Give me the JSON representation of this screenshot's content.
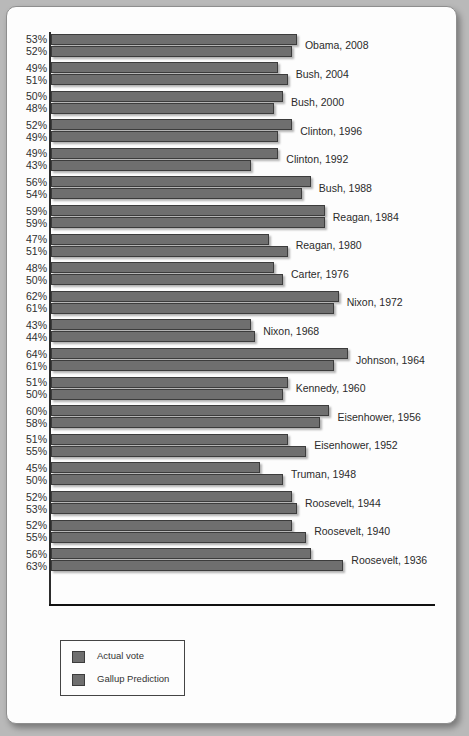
{
  "legend": {
    "items": [
      {
        "label": "Actual vote",
        "color": "#6f6f6f"
      },
      {
        "label": "Gallup Prediction",
        "color": "#6f6f6f"
      }
    ]
  },
  "chart_data": {
    "type": "bar",
    "orientation": "horizontal",
    "title": "",
    "xlabel": "",
    "ylabel": "",
    "xlim": [
      0,
      70
    ],
    "grid": false,
    "legend_position": "bottom-left",
    "categories": [
      "Obama, 2008",
      "Bush, 2004",
      "Bush, 2000",
      "Clinton, 1996",
      "Clinton, 1992",
      "Bush, 1988",
      "Reagan, 1984",
      "Reagan, 1980",
      "Carter, 1976",
      "Nixon, 1972",
      "Nixon, 1968",
      "Johnson, 1964",
      "Kennedy, 1960",
      "Eisenhower, 1956",
      "Eisenhower, 1952",
      "Truman, 1948",
      "Roosevelt, 1944",
      "Roosevelt, 1940",
      "Roosevelt, 1936"
    ],
    "series": [
      {
        "name": "Actual vote",
        "values": [
          53,
          49,
          50,
          52,
          49,
          56,
          59,
          47,
          48,
          62,
          43,
          64,
          51,
          60,
          51,
          45,
          52,
          52,
          56
        ]
      },
      {
        "name": "Gallup Prediction",
        "values": [
          52,
          51,
          48,
          49,
          43,
          54,
          59,
          51,
          50,
          61,
          44,
          61,
          50,
          58,
          55,
          50,
          53,
          55,
          63
        ]
      }
    ],
    "value_labels": {
      "actual": [
        "53%",
        "49%",
        "50%",
        "52%",
        "49%",
        "56%",
        "59%",
        "47%",
        "48%",
        "62%",
        "43%",
        "64%",
        "51%",
        "60%",
        "51%",
        "45%",
        "52%",
        "52%",
        "56%"
      ],
      "gallup": [
        "52%",
        "51%",
        "48%",
        "49%",
        "43%",
        "54%",
        "59%",
        "51%",
        "50%",
        "61%",
        "44%",
        "61%",
        "50%",
        "58%",
        "55%",
        "50%",
        "53%",
        "55%",
        "63%"
      ]
    }
  }
}
